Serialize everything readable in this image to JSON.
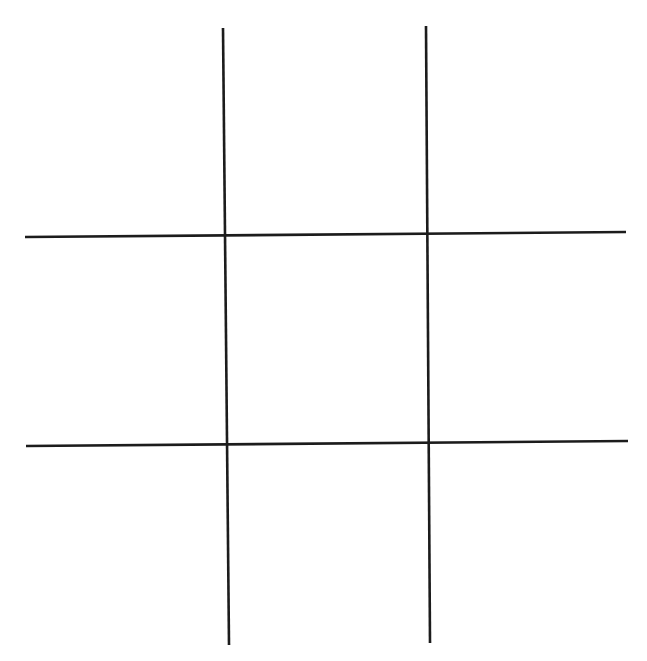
{
  "game": {
    "name": "tic-tac-toe",
    "line_color": "#1c1c1c",
    "line_width": 2.6,
    "grid_lines": {
      "vertical": [
        {
          "x1": 223,
          "y1": 28,
          "x2": 229,
          "y2": 645
        },
        {
          "x1": 426,
          "y1": 26,
          "x2": 430,
          "y2": 643
        }
      ],
      "horizontal": [
        {
          "x1": 25,
          "y1": 237,
          "x2": 626,
          "y2": 232
        },
        {
          "x1": 26,
          "y1": 446,
          "x2": 628,
          "y2": 441
        }
      ]
    },
    "cells": [
      {
        "row": 0,
        "col": 0,
        "mark": ""
      },
      {
        "row": 0,
        "col": 1,
        "mark": ""
      },
      {
        "row": 0,
        "col": 2,
        "mark": ""
      },
      {
        "row": 1,
        "col": 0,
        "mark": ""
      },
      {
        "row": 1,
        "col": 1,
        "mark": ""
      },
      {
        "row": 1,
        "col": 2,
        "mark": ""
      },
      {
        "row": 2,
        "col": 0,
        "mark": ""
      },
      {
        "row": 2,
        "col": 1,
        "mark": ""
      },
      {
        "row": 2,
        "col": 2,
        "mark": ""
      }
    ]
  }
}
